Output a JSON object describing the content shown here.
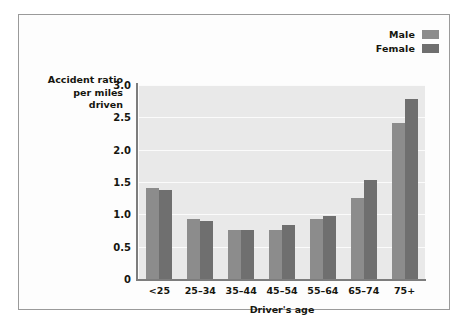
{
  "chart_data": {
    "type": "bar",
    "title": "",
    "categories": [
      "<25",
      "25–34",
      "35–44",
      "45–54",
      "55–64",
      "65–74",
      "75+"
    ],
    "series": [
      {
        "name": "Male",
        "color": "#8c8c8c",
        "values": [
          1.4,
          0.93,
          0.76,
          0.76,
          0.93,
          1.26,
          2.42
        ]
      },
      {
        "name": "Female",
        "color": "#6f6f6f",
        "values": [
          1.38,
          0.9,
          0.76,
          0.83,
          0.98,
          1.53,
          2.78
        ]
      }
    ],
    "xlabel": "Driver's age",
    "ylabel": "Accident ratio per miles driven",
    "ylabel_lines": [
      "Accident ratio",
      "per miles",
      "driven"
    ],
    "yticks": [
      "0",
      "0.5",
      "1.0",
      "1.5",
      "2.0",
      "2.5",
      "3.0"
    ],
    "ytick_values": [
      0,
      0.5,
      1.0,
      1.5,
      2.0,
      2.5,
      3.0
    ],
    "ylim": [
      0,
      3.0
    ],
    "grid": "horizontal",
    "legend_position": "top-right",
    "plot_background": "#e9e9e9",
    "gridline_color": "#fbfbfb",
    "axis_color": "#7d7d7d",
    "figure_background": "#fdfdfd",
    "figure_border": "#9a9a9a"
  }
}
